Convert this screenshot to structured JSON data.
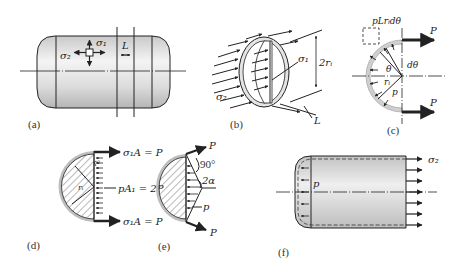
{
  "figure": {
    "panels": [
      {
        "id": "a",
        "caption": "(a)",
        "labels": {
          "hoop_stress": "σ₁",
          "axial_stress": "σ₂",
          "length": "L"
        }
      },
      {
        "id": "b",
        "caption": "(b)",
        "labels": {
          "hoop_stress": "σ₁",
          "diameter": "2rᵢ",
          "axial_stress": "σ₂",
          "length": "L"
        }
      },
      {
        "id": "c",
        "caption": "(c)",
        "labels": {
          "element_force": "pLrᵢdθ",
          "force_top": "P",
          "force_bottom": "P",
          "angle": "θ",
          "dangle": "dθ",
          "radius": "rᵢ",
          "pressure": "p"
        }
      },
      {
        "id": "d",
        "caption": "(d)",
        "labels": {
          "top_eq": "σ₁A = P",
          "mid_eq": "pA₁ = 2P",
          "bottom_eq": "σ₁A = P",
          "radius_outer": "r₀",
          "radius_inner": "rᵢ"
        }
      },
      {
        "id": "e",
        "caption": "(e)",
        "labels": {
          "force_top": "P",
          "force_bottom": "P",
          "angle_right": "90°",
          "angle_2a": "2α",
          "pressure": "p"
        }
      },
      {
        "id": "f",
        "caption": "(f)",
        "labels": {
          "axial_stress": "σ₂",
          "pressure": "p"
        }
      }
    ],
    "colors": {
      "ink": "#222222",
      "shell_light": "#f2f2f2",
      "shell_dark": "#bdbdbd",
      "radius_label": "#8a3a4a"
    }
  }
}
